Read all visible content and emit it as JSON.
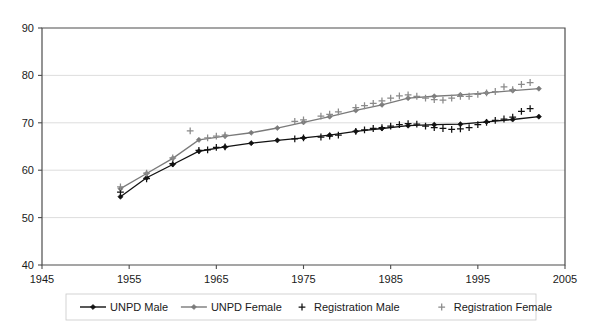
{
  "chart_data": {
    "type": "line",
    "title": "",
    "subtitle": "",
    "xlabel": "",
    "ylabel": "",
    "xlim": [
      1945,
      2005
    ],
    "ylim": [
      40,
      90
    ],
    "xticks": [
      1945,
      1955,
      1965,
      1975,
      1985,
      1995,
      2005
    ],
    "yticks": [
      40,
      50,
      60,
      70,
      80,
      90
    ],
    "grid": "horizontal",
    "legend_position": "bottom",
    "series": [
      {
        "name": "UNPD Male",
        "marker": "diamond",
        "color": "#111111",
        "style": "line-marker",
        "x": [
          1954,
          1957,
          1960,
          1963,
          1966,
          1969,
          1972,
          1975,
          1978,
          1981,
          1984,
          1987,
          1990,
          1993,
          1996,
          1999,
          2002
        ],
        "y": [
          54.4,
          58.4,
          61.2,
          64.0,
          64.9,
          65.7,
          66.3,
          66.8,
          67.4,
          68.2,
          68.8,
          69.4,
          69.6,
          69.7,
          70.2,
          70.7,
          71.3
        ]
      },
      {
        "name": "UNPD Female",
        "marker": "diamond",
        "color": "#7a7a7a",
        "style": "line-marker",
        "x": [
          1954,
          1957,
          1960,
          1963,
          1966,
          1969,
          1972,
          1975,
          1978,
          1981,
          1984,
          1987,
          1990,
          1993,
          1996,
          1999,
          2002
        ],
        "y": [
          56.1,
          59.3,
          62.5,
          66.4,
          67.2,
          67.9,
          68.9,
          70.1,
          71.3,
          72.6,
          73.8,
          75.2,
          75.6,
          75.9,
          76.3,
          76.8,
          77.2
        ]
      },
      {
        "name": "Registration Male",
        "marker": "plus",
        "color": "#111111",
        "style": "markers",
        "x": [
          1954,
          1957,
          1960,
          1963,
          1964,
          1965,
          1966,
          1974,
          1975,
          1977,
          1978,
          1979,
          1981,
          1982,
          1983,
          1984,
          1985,
          1986,
          1987,
          1988,
          1989,
          1990,
          1991,
          1992,
          1993,
          1994,
          1995,
          1996,
          1997,
          1998,
          1999,
          2000,
          2001
        ],
        "y": [
          55.4,
          58.2,
          61.4,
          64.2,
          64.3,
          64.8,
          64.9,
          66.6,
          66.8,
          67.0,
          67.2,
          67.4,
          68.2,
          68.5,
          68.8,
          69.0,
          69.3,
          69.6,
          69.8,
          69.7,
          69.3,
          69.0,
          68.8,
          68.6,
          68.7,
          69.0,
          69.6,
          70.1,
          70.5,
          70.8,
          71.2,
          72.4,
          73.0
        ]
      },
      {
        "name": "Registration Female",
        "marker": "plus",
        "color": "#8a8a8a",
        "style": "markers",
        "x": [
          1954,
          1957,
          1960,
          1962,
          1964,
          1965,
          1966,
          1974,
          1975,
          1977,
          1978,
          1979,
          1981,
          1982,
          1983,
          1984,
          1985,
          1986,
          1987,
          1988,
          1989,
          1990,
          1991,
          1992,
          1993,
          1994,
          1995,
          1996,
          1997,
          1998,
          1999,
          2000,
          2001
        ],
        "y": [
          56.5,
          59.4,
          62.6,
          68.3,
          66.8,
          67.2,
          67.4,
          70.3,
          70.6,
          71.4,
          71.8,
          72.3,
          73.2,
          73.6,
          74.1,
          74.6,
          75.2,
          75.7,
          75.9,
          75.6,
          75.2,
          74.9,
          74.8,
          75.2,
          75.6,
          75.6,
          76.0,
          76.3,
          76.6,
          77.6,
          77.0,
          78.1,
          78.5
        ]
      }
    ]
  },
  "legend": {
    "items": [
      {
        "label": "UNPD Male",
        "marker": "diamond-line",
        "color": "#111111"
      },
      {
        "label": "UNPD Female",
        "marker": "diamond-line",
        "color": "#7a7a7a"
      },
      {
        "label": "Registration Male",
        "marker": "plus",
        "color": "#111111"
      },
      {
        "label": "Registration Female",
        "marker": "plus",
        "color": "#8a8a8a"
      }
    ]
  }
}
